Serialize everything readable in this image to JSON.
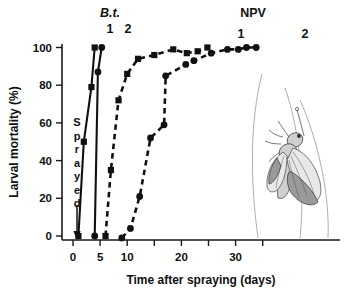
{
  "chart_data": {
    "type": "scatter",
    "title": "",
    "xlabel": "Time after spraying (days)",
    "ylabel": "Larval mortality (%)",
    "xlim": [
      -2,
      36
    ],
    "ylim": [
      -4,
      104
    ],
    "grid": false,
    "legend_position": "inline-annotations",
    "x_ticks": [
      0,
      5,
      10,
      15,
      20,
      25,
      30,
      35
    ],
    "x_tick_labels": [
      "0",
      "5",
      "10",
      "",
      "20",
      "",
      "30",
      ""
    ],
    "y_ticks": [
      0,
      20,
      40,
      60,
      80,
      100
    ],
    "y_tick_labels": [
      "0",
      "20",
      "40",
      "60",
      "80",
      "100"
    ],
    "annotations": [
      {
        "name": "bt-group-label",
        "text": "B.t.",
        "italic": true,
        "x": 110,
        "y": 17
      },
      {
        "name": "bt-curve-1-number",
        "text": "1",
        "x": 110,
        "y": 33
      },
      {
        "name": "bt-curve-2-number",
        "text": "2",
        "x": 128,
        "y": 33
      },
      {
        "name": "npv-group-label",
        "text": "NPV",
        "italic": false,
        "x": 253,
        "y": 17
      },
      {
        "name": "npv-curve-1-number",
        "text": "1",
        "x": 241,
        "y": 38
      },
      {
        "name": "npv-curve-2-number",
        "text": "2",
        "x": 305,
        "y": 38
      }
    ],
    "spray_marker": {
      "text": "Sprayed",
      "letters": [
        "S",
        "p",
        "r",
        "a",
        "y",
        "e",
        "d"
      ],
      "arrow": "down-arrow-at-day-zero"
    },
    "series": [
      {
        "name": "B.t. 1",
        "label": "1",
        "group": "B.t.",
        "marker": "square",
        "line": "solid",
        "points": [
          {
            "x": 1.0,
            "y": 0
          },
          {
            "x": 2.0,
            "y": 50
          },
          {
            "x": 3.4,
            "y": 79
          },
          {
            "x": 4.0,
            "y": 100
          }
        ]
      },
      {
        "name": "B.t. 2",
        "label": "2",
        "group": "B.t.",
        "marker": "circle",
        "line": "solid",
        "points": [
          {
            "x": 4.0,
            "y": 0
          },
          {
            "x": 4.6,
            "y": 87
          },
          {
            "x": 5.3,
            "y": 100
          }
        ]
      },
      {
        "name": "NPV 1",
        "label": "1",
        "group": "NPV",
        "marker": "square",
        "line": "dashed",
        "points": [
          {
            "x": 6.0,
            "y": 0
          },
          {
            "x": 7.0,
            "y": 35
          },
          {
            "x": 8.4,
            "y": 72
          },
          {
            "x": 10.0,
            "y": 86
          },
          {
            "x": 12.0,
            "y": 94
          },
          {
            "x": 15.0,
            "y": 96
          },
          {
            "x": 18.5,
            "y": 99
          },
          {
            "x": 21.0,
            "y": 97
          },
          {
            "x": 23.0,
            "y": 98
          },
          {
            "x": 24.8,
            "y": 100
          }
        ]
      },
      {
        "name": "NPV 2",
        "label": "2",
        "group": "NPV",
        "marker": "circle",
        "line": "dashed",
        "points": [
          {
            "x": 9.0,
            "y": -1
          },
          {
            "x": 10.6,
            "y": 4
          },
          {
            "x": 12.3,
            "y": 21
          },
          {
            "x": 14.3,
            "y": 52
          },
          {
            "x": 16.8,
            "y": 59
          },
          {
            "x": 17.1,
            "y": 85
          },
          {
            "x": 20.8,
            "y": 91
          },
          {
            "x": 22.3,
            "y": 93
          },
          {
            "x": 25.5,
            "y": 97
          },
          {
            "x": 28.5,
            "y": 99
          },
          {
            "x": 30.5,
            "y": 99
          },
          {
            "x": 32.0,
            "y": 100
          },
          {
            "x": 33.8,
            "y": 100
          }
        ]
      }
    ],
    "illustration": {
      "name": "moth-illustration",
      "description": "line drawing of an adult moth at lower right"
    }
  }
}
